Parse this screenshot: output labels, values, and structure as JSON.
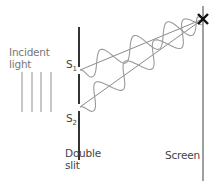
{
  "diagram": {
    "labels": {
      "incident_line1": "Incident",
      "incident_line2": "light",
      "s1_main": "S",
      "s1_sub": "1",
      "s2_main": "S",
      "s2_sub": "2",
      "slit_line1": "Double",
      "slit_line2": "slit",
      "screen": "Screen"
    },
    "colors": {
      "barrier": "#333333",
      "screen": "#888888",
      "wave": "#9a9a9a",
      "ray": "#8a8a8a",
      "incident": "#999999",
      "marker": "#111111",
      "label": "#777777"
    },
    "geometry": {
      "barrier_x": 79,
      "barrier_segments": [
        [
          27,
          67
        ],
        [
          74,
          104
        ],
        [
          111,
          160
        ]
      ],
      "screen_x": 203,
      "screen_y": [
        6,
        181
      ],
      "slit1": [
        80,
        70
      ],
      "slit2": [
        80,
        107
      ],
      "target": [
        203,
        19
      ],
      "incident_lines_x": [
        22,
        32,
        41,
        51
      ],
      "incident_lines_y": [
        72,
        112
      ],
      "wave_amplitude": 11,
      "wave_wavelength": 36
    }
  }
}
